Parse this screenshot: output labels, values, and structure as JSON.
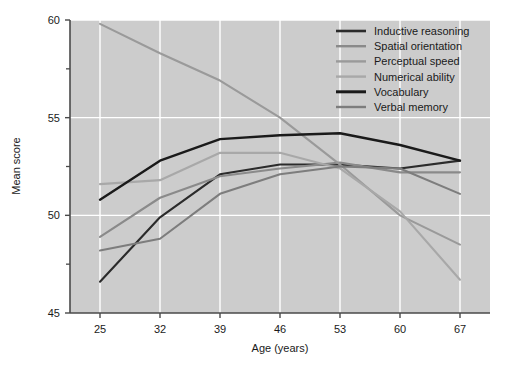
{
  "chart_data": {
    "type": "line",
    "title": "",
    "xlabel": "Age (years)",
    "ylabel": "Mean score",
    "x": [
      25,
      32,
      39,
      46,
      53,
      60,
      67
    ],
    "categories": [
      "25",
      "32",
      "39",
      "46",
      "53",
      "60",
      "67"
    ],
    "xlim": [
      21.5,
      70.5
    ],
    "ylim": [
      45,
      60
    ],
    "yticks": [
      45,
      50,
      55,
      60
    ],
    "ytick_labels": [
      "45",
      "50",
      "55",
      "60"
    ],
    "yminorticks": [
      47.5,
      52.5,
      57.5
    ],
    "grid": true,
    "grid_color": "#ffffff",
    "plot_background": "#cccccc",
    "legend_position": "top-right",
    "series": [
      {
        "name": "Inductive reasoning",
        "color": "#2b2b2b",
        "width": 2.1,
        "values": [
          46.6,
          49.9,
          52.1,
          52.6,
          52.6,
          52.4,
          52.8
        ]
      },
      {
        "name": "Spatial orientation",
        "color": "#8a8a8a",
        "width": 2.1,
        "values": [
          48.9,
          50.9,
          52.0,
          52.4,
          52.7,
          52.2,
          52.2
        ]
      },
      {
        "name": "Perceptual speed",
        "color": "#9a9a9a",
        "width": 2.1,
        "values": [
          59.8,
          58.3,
          56.9,
          55.0,
          52.6,
          50.0,
          48.5
        ]
      },
      {
        "name": "Numerical ability",
        "color": "#a8a8a8",
        "width": 2.1,
        "values": [
          51.6,
          51.8,
          53.2,
          53.2,
          52.4,
          50.2,
          46.7
        ]
      },
      {
        "name": "Vocabulary",
        "color": "#1a1a1a",
        "width": 2.4,
        "values": [
          50.8,
          52.8,
          53.9,
          54.1,
          54.2,
          53.6,
          52.8
        ]
      },
      {
        "name": "Verbal memory",
        "color": "#7d7d7d",
        "width": 2.1,
        "values": [
          48.2,
          48.8,
          51.1,
          52.1,
          52.5,
          52.4,
          51.1
        ]
      }
    ],
    "legend_entries": [
      {
        "label": "Inductive reasoning",
        "color": "#2b2b2b",
        "width": 2.6
      },
      {
        "label": "Spatial orientation",
        "color": "#8a8a8a",
        "width": 2.4
      },
      {
        "label": "Perceptual speed",
        "color": "#9a9a9a",
        "width": 2.4
      },
      {
        "label": "Numerical ability",
        "color": "#a8a8a8",
        "width": 2.4
      },
      {
        "label": "Vocabulary",
        "color": "#1a1a1a",
        "width": 3.0
      },
      {
        "label": "Verbal memory",
        "color": "#7d7d7d",
        "width": 2.4
      }
    ]
  }
}
